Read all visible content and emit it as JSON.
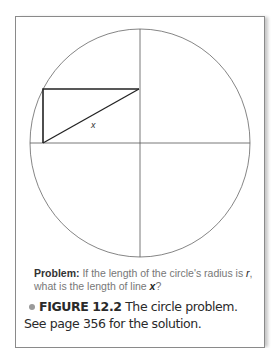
{
  "diagram": {
    "triangle_label": "x",
    "stroke_color": "#555555",
    "triangle_color": "#222222"
  },
  "problem": {
    "label": "Problem:",
    "text_part1": " If the length of the circle's radius is ",
    "radius_var": "r",
    "text_part2": ",",
    "text_line2": "what is the length of line ",
    "line_var": "x",
    "text_end": "?"
  },
  "caption": {
    "figure_label": "FIGURE 12.2",
    "text": "  The circle problem. See page 356 for the solution."
  }
}
